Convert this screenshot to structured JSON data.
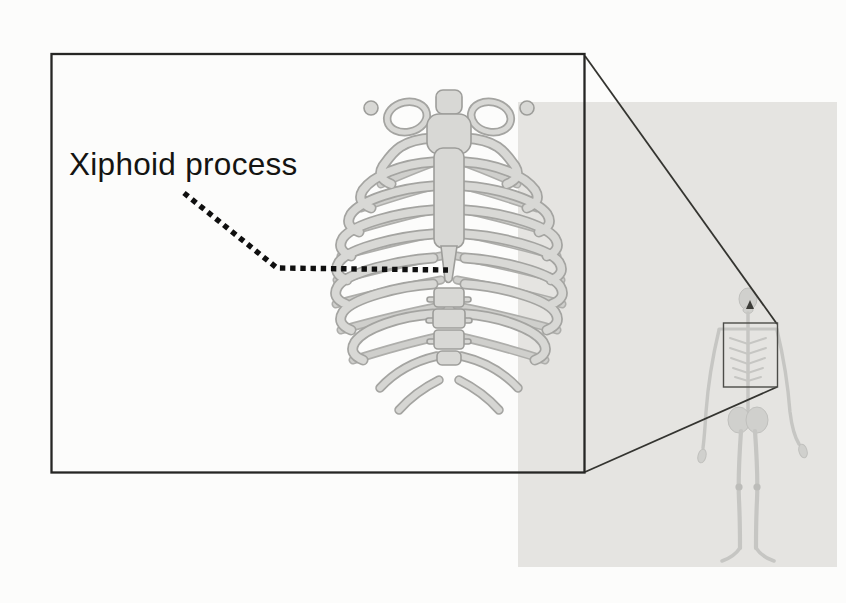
{
  "figure": {
    "label": "Xiphoid process",
    "detail_view": {
      "illustration": "rib-cage-anterior-view"
    },
    "context_view": {
      "illustration": "full-body-skeleton",
      "marker": "thorax-highlight-box"
    },
    "colors": {
      "page_background": "#fcfcfb",
      "highlight_fill": "#e5e4e1",
      "detail_box_border": "#262624",
      "connector_line": "#343430",
      "source_box_border": "#4c4c48",
      "leader_dots": "#0f0f0f",
      "label_text": "#141412",
      "bone_fill": "#d8d8d5",
      "bone_outline": "#a4a4a1",
      "skeleton_tone": "#c6c6c3"
    }
  }
}
